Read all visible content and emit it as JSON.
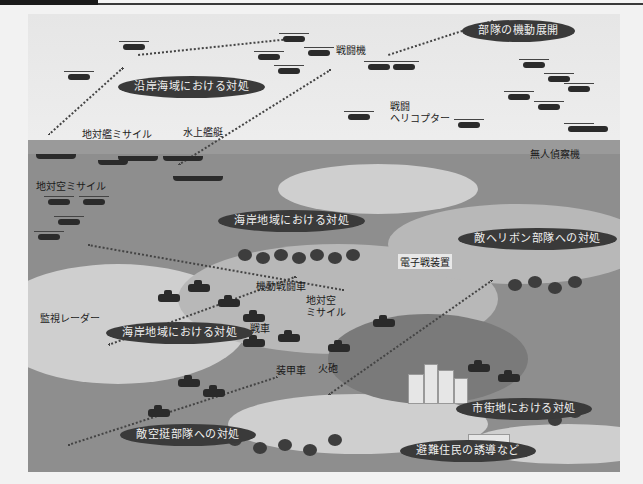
{
  "figure": {
    "type": "illustration",
    "palette": {
      "sky": "#ececec",
      "sea": "#9a9a9a",
      "land": "#8e8e8e",
      "pill_bg": "#3a3a3a",
      "pill_text": "#f0f0f0",
      "label_text": "#222222"
    }
  },
  "callouts": {
    "mobility": "部隊の機動展開",
    "coastal_sea": "沿岸海域における対処",
    "coastal_area_upper": "海岸地域における対処",
    "enemy_heliborne": "敵ヘリボン部隊への対処",
    "coastal_area_lower": "海岸地域における対処",
    "urban": "市街地における対処",
    "airborne": "敵空挺部隊への対処",
    "evacuation": "避難住民の誘導など"
  },
  "labels": {
    "fighter": "戦闘機",
    "attack_heli_1": "戦闘",
    "attack_heli_2": "ヘリコプター",
    "anti_ship_missile": "地対艦ミサイル",
    "surface_ship": "水上艦艇",
    "sam_coast": "地対空ミサイル",
    "uav": "無人偵察機",
    "ew_unit": "電子戦装置",
    "mobile_combat_vehicle": "機動戦闘車",
    "sam_inland_1": "地対空",
    "sam_inland_2": "ミサイル",
    "surveillance_radar": "監視レーダー",
    "tank": "戦車",
    "apc": "装甲車",
    "artillery": "火砲"
  }
}
